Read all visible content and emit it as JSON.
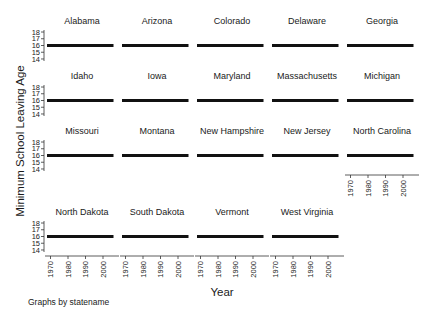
{
  "chart_data": {
    "type": "line",
    "layout": "small-multiples",
    "title": "",
    "xlabel": "Year",
    "ylabel": "Minimum School Leaving Age",
    "note": "Graphs by statename",
    "x_ticks": [
      1970,
      1980,
      1990,
      2000
    ],
    "y_ticks": [
      14,
      15,
      16,
      17,
      18
    ],
    "xlim": [
      1968,
      2008
    ],
    "ylim": [
      13.7,
      18.3
    ],
    "grid": false,
    "legend": "none",
    "line_color": "#111111",
    "panels": [
      {
        "state": "Alabama",
        "x": [
          1968,
          2006
        ],
        "y": [
          16,
          16
        ]
      },
      {
        "state": "Arizona",
        "x": [
          1968,
          2006
        ],
        "y": [
          16,
          16
        ]
      },
      {
        "state": "Colorado",
        "x": [
          1968,
          2006
        ],
        "y": [
          16,
          16
        ]
      },
      {
        "state": "Delaware",
        "x": [
          1968,
          2006
        ],
        "y": [
          16,
          16
        ]
      },
      {
        "state": "Georgia",
        "x": [
          1968,
          2006
        ],
        "y": [
          16,
          16
        ]
      },
      {
        "state": "Idaho",
        "x": [
          1968,
          2006
        ],
        "y": [
          16,
          16
        ]
      },
      {
        "state": "Iowa",
        "x": [
          1968,
          2006
        ],
        "y": [
          16,
          16
        ]
      },
      {
        "state": "Maryland",
        "x": [
          1968,
          2006
        ],
        "y": [
          16,
          16
        ]
      },
      {
        "state": "Massachusetts",
        "x": [
          1968,
          2006
        ],
        "y": [
          16,
          16
        ]
      },
      {
        "state": "Michigan",
        "x": [
          1968,
          2006
        ],
        "y": [
          16,
          16
        ]
      },
      {
        "state": "Missouri",
        "x": [
          1968,
          2006
        ],
        "y": [
          16,
          16
        ]
      },
      {
        "state": "Montana",
        "x": [
          1968,
          2006
        ],
        "y": [
          16,
          16
        ]
      },
      {
        "state": "New Hampshire",
        "x": [
          1968,
          2006
        ],
        "y": [
          16,
          16
        ]
      },
      {
        "state": "New Jersey",
        "x": [
          1968,
          2006
        ],
        "y": [
          16,
          16
        ]
      },
      {
        "state": "North Carolina",
        "x": [
          1968,
          2006
        ],
        "y": [
          16,
          16
        ]
      },
      {
        "state": "North Dakota",
        "x": [
          1968,
          2006
        ],
        "y": [
          16,
          16
        ]
      },
      {
        "state": "South Dakota",
        "x": [
          1968,
          2006
        ],
        "y": [
          16,
          16
        ]
      },
      {
        "state": "Vermont",
        "x": [
          1968,
          2006
        ],
        "y": [
          16,
          16
        ]
      },
      {
        "state": "West Virginia",
        "x": [
          1968,
          2006
        ],
        "y": [
          16,
          16
        ]
      }
    ]
  }
}
